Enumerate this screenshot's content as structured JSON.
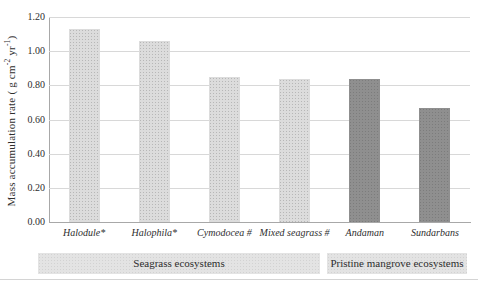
{
  "chart_data": {
    "type": "bar",
    "title": "",
    "ylabel": "Mass accumulation rate ( g cm-2 yr-1)",
    "ylabel_parts": {
      "main": "Mass accumulation rate ( g cm",
      "sup1": "-2",
      "mid": " yr",
      "sup2": "-1",
      "end": ")"
    },
    "categories": [
      "Halodule*",
      "Halophila*",
      "Cymodocea #",
      "Mixed seagrass #",
      "Andaman",
      "Sundarbans"
    ],
    "values": [
      1.13,
      1.06,
      0.85,
      0.84,
      0.84,
      0.67
    ],
    "group_of": [
      0,
      0,
      0,
      0,
      1,
      1
    ],
    "groups": [
      {
        "label": "Seagrass ecosystems",
        "bar_color": "#dcdcdc"
      },
      {
        "label": "Pristine mangrove ecosystems",
        "bar_color": "#8f8f8f"
      }
    ],
    "ylim": [
      0,
      1.2
    ],
    "ytick_step": 0.2,
    "yticks": [
      "0.00",
      "0.20",
      "0.40",
      "0.60",
      "0.80",
      "1.00",
      "1.20"
    ],
    "grid": true,
    "legend_position": "none",
    "colors": {
      "gridline": "#d8d8d8",
      "axis": "#a8a8a8",
      "text": "#2e2e2e",
      "band_background": "#e3e3e3"
    }
  }
}
